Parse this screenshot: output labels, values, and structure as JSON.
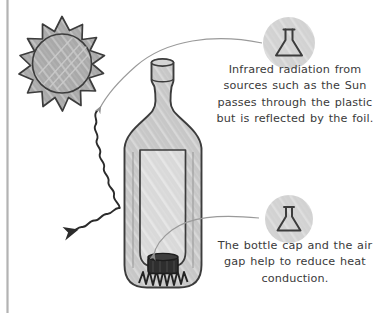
{
  "figure": {
    "left_border_color": "#b3b3b3",
    "background_color": "#ffffff"
  },
  "sun": {
    "icon": "sun-icon",
    "fill_color": "#a9a9a9",
    "stroke_color": "#3c3c3c",
    "spike_count": 14
  },
  "bottle": {
    "icon": "plastic-bottle-icon",
    "fill_color": "#c9c9c9",
    "stroke_color": "#3c3c3c",
    "cap": {
      "icon": "bottle-cap-icon",
      "fill_color": "#2e2e2e"
    },
    "inner_container": {
      "icon": "inner-container-icon",
      "fill_color": "#d9d9d9"
    }
  },
  "radiation_arrow": {
    "icon": "wavy-reflected-ray-icon",
    "stroke_color": "#2b2b2b"
  },
  "callouts": [
    {
      "badge_icon": "flask-icon",
      "badge_fill": "#d2d2d2",
      "badge_stroke": "#3c3c3c",
      "text": "Infrared radiation from sources such as the Sun passes through the plastic but is reflected by the foil."
    },
    {
      "badge_icon": "flask-icon",
      "badge_fill": "#d2d2d2",
      "badge_stroke": "#3c3c3c",
      "text": "The bottle cap and the air gap help to reduce heat conduction."
    }
  ],
  "leader_lines": {
    "top": "curved-leader-line-top",
    "bottom": "curved-leader-line-bottom",
    "color": "#9a9a9a"
  }
}
